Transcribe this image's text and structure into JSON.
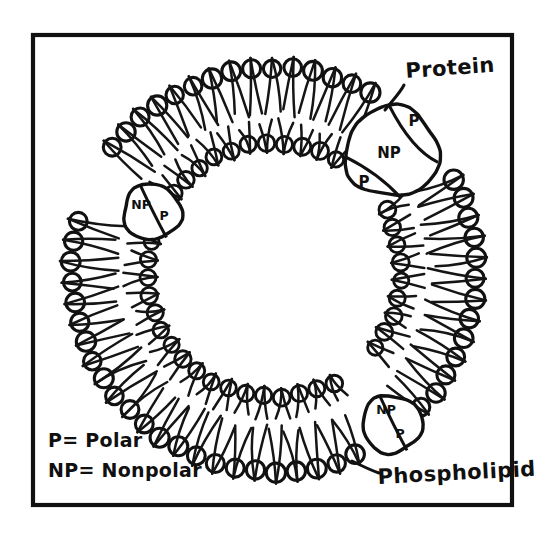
{
  "figure": {
    "title_alt": "Phospholipid bilayer vesicle cross-section",
    "background_color": "#ffffff",
    "ink_color": "#111111",
    "frame": {
      "x": 33,
      "y": 35,
      "width": 479,
      "height": 470
    }
  },
  "labels": {
    "protein": "Protein",
    "phospholipid": "Phospholipid"
  },
  "legend": {
    "polar": "P= Polar",
    "nonpolar": "NP= Nonpolar"
  },
  "proteins": [
    {
      "id": "protein-top-right",
      "cx": 392,
      "cy": 152,
      "r": 47,
      "regions": [
        {
          "code": "P",
          "tx": 414,
          "ty": 126
        },
        {
          "code": "NP",
          "tx": 389,
          "ty": 158
        },
        {
          "code": "P",
          "tx": 364,
          "ty": 187
        }
      ]
    },
    {
      "id": "protein-left",
      "cx": 152,
      "cy": 212,
      "r": 29,
      "regions": [
        {
          "code": "NP",
          "tx": 141,
          "ty": 209
        },
        {
          "code": "P",
          "tx": 164,
          "ty": 220
        }
      ]
    },
    {
      "id": "protein-bottom-right",
      "cx": 392,
      "cy": 424,
      "r": 30,
      "regions": [
        {
          "code": "NP",
          "tx": 386,
          "ty": 414
        },
        {
          "code": "P",
          "tx": 400,
          "ty": 438
        }
      ]
    }
  ],
  "vesicle": {
    "center_x": 274,
    "center_y": 270,
    "outer_head_radius": 202,
    "outer_tail_end_radius": 158,
    "inner_tail_start_radius": 148,
    "inner_head_radius": 127,
    "outer_head_size": 9.2,
    "inner_head_size": 8.0,
    "outer_lipid_count": 62,
    "inner_lipid_count": 44
  },
  "chart_data": {
    "type": "diagram",
    "annotations": [
      "Protein",
      "Phospholipid",
      "P= Polar",
      "NP= Nonpolar"
    ],
    "components": [
      {
        "name": "outer leaflet",
        "count": 62,
        "description": "polar heads outward, nonpolar tails inward"
      },
      {
        "name": "inner leaflet",
        "count": 44,
        "description": "polar heads inward, nonpolar tails outward"
      },
      {
        "name": "integral proteins",
        "count": 3,
        "regions": [
          "P",
          "NP",
          "P"
        ]
      }
    ]
  }
}
